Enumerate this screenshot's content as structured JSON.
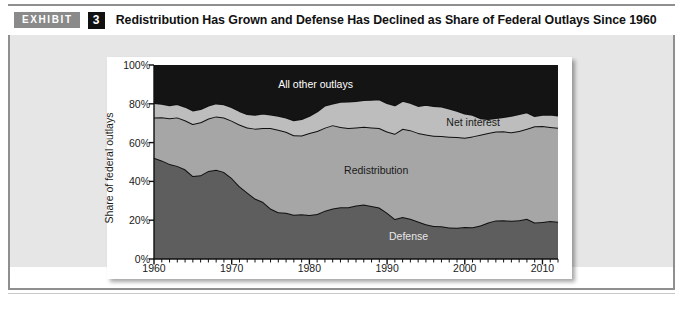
{
  "header": {
    "badge_label": "EXHIBIT",
    "exhibit_number": "3",
    "title": "Redistribution Has Grown and Defense Has Declined as Share of Federal Outlays Since 1960"
  },
  "chart_data": {
    "type": "area",
    "stacked": true,
    "title": "",
    "xlabel": "",
    "ylabel": "Share of federal outlays",
    "xlim": [
      1960,
      2012
    ],
    "ylim": [
      0,
      100
    ],
    "yticks": [
      "0%",
      "20%",
      "40%",
      "60%",
      "80%",
      "100%"
    ],
    "ytick_values": [
      0,
      20,
      40,
      60,
      80,
      100
    ],
    "xticks": [
      "1960",
      "1970",
      "1980",
      "1990",
      "2000",
      "2010"
    ],
    "xtick_values": [
      1960,
      1970,
      1980,
      1990,
      2000,
      2010
    ],
    "minor_tick_interval": 1,
    "grid": false,
    "legend": "inline-labels",
    "x": [
      1960,
      1961,
      1962,
      1963,
      1964,
      1965,
      1966,
      1967,
      1968,
      1969,
      1970,
      1971,
      1972,
      1973,
      1974,
      1975,
      1976,
      1977,
      1978,
      1979,
      1980,
      1981,
      1982,
      1983,
      1984,
      1985,
      1986,
      1987,
      1988,
      1989,
      1990,
      1991,
      1992,
      1993,
      1994,
      1995,
      1996,
      1997,
      1998,
      1999,
      2000,
      2001,
      2002,
      2003,
      2004,
      2005,
      2006,
      2007,
      2008,
      2009,
      2010,
      2011,
      2012
    ],
    "series": [
      {
        "name": "Defense",
        "color": "#5e5e5e",
        "label_color": "#e8e8e8",
        "values": [
          52.2,
          50.8,
          49.0,
          48.0,
          46.2,
          42.8,
          43.2,
          45.4,
          46.0,
          44.9,
          41.8,
          37.5,
          34.3,
          31.2,
          29.5,
          26.0,
          24.1,
          23.8,
          22.8,
          23.1,
          22.7,
          23.2,
          24.9,
          26.0,
          26.7,
          26.7,
          27.6,
          28.1,
          27.3,
          26.5,
          23.9,
          20.6,
          21.6,
          20.7,
          19.3,
          17.9,
          17.0,
          16.9,
          16.2,
          16.1,
          16.5,
          16.4,
          17.3,
          18.8,
          19.9,
          20.0,
          19.7,
          20.0,
          20.7,
          18.8,
          19.1,
          19.6,
          19.2
        ]
      },
      {
        "name": "Redistribution",
        "color": "#a6a6a6",
        "label_color": "#1a1a1a",
        "values": [
          20.8,
          22.3,
          23.5,
          25.0,
          25.3,
          26.8,
          27.3,
          27.0,
          27.5,
          28.0,
          29.5,
          31.8,
          33.5,
          36.0,
          38.0,
          41.5,
          42.5,
          41.8,
          41.0,
          40.6,
          42.2,
          42.8,
          42.8,
          43.0,
          41.3,
          40.8,
          40.2,
          40.1,
          40.5,
          41.0,
          41.8,
          44.0,
          45.5,
          45.7,
          45.7,
          46.3,
          46.5,
          46.5,
          46.8,
          46.8,
          46.0,
          46.8,
          46.8,
          46.2,
          45.8,
          45.8,
          45.6,
          46.0,
          46.4,
          49.6,
          49.5,
          48.5,
          48.4
        ]
      },
      {
        "name": "Net interest",
        "color": "#bdbdbd",
        "label_color": "#1a1a1a",
        "values": [
          7.4,
          6.9,
          6.7,
          6.9,
          7.0,
          7.0,
          6.8,
          6.7,
          6.7,
          6.9,
          7.0,
          7.0,
          6.9,
          7.1,
          7.5,
          7.0,
          7.2,
          7.3,
          7.7,
          8.4,
          8.9,
          10.1,
          11.4,
          11.1,
          13.0,
          13.7,
          13.7,
          13.8,
          14.3,
          14.8,
          14.7,
          14.6,
          14.4,
          14.1,
          13.9,
          15.3,
          15.4,
          15.2,
          14.6,
          13.5,
          12.5,
          11.1,
          8.5,
          7.1,
          7.0,
          7.4,
          8.5,
          8.7,
          8.5,
          5.3,
          5.7,
          6.4,
          6.3
        ]
      },
      {
        "name": "All other outlays",
        "color": "#141414",
        "label_color": "#ffffff",
        "values": [
          19.6,
          20.0,
          20.8,
          20.1,
          21.5,
          23.4,
          22.7,
          20.9,
          19.8,
          20.2,
          21.7,
          23.7,
          25.3,
          25.7,
          25.0,
          25.5,
          26.2,
          27.1,
          28.5,
          27.9,
          26.2,
          23.9,
          20.9,
          19.9,
          19.0,
          18.8,
          18.5,
          18.0,
          17.9,
          17.7,
          19.6,
          20.8,
          18.5,
          19.5,
          21.1,
          20.5,
          21.1,
          21.4,
          22.4,
          23.6,
          25.0,
          25.7,
          27.4,
          27.9,
          27.3,
          26.8,
          26.2,
          25.3,
          24.4,
          26.3,
          25.7,
          25.5,
          26.1
        ]
      }
    ],
    "annotations": [
      {
        "text": "All other outlays",
        "x_pct": 40,
        "y_pct": 90,
        "color": "#ffffff"
      },
      {
        "text": "Net interest",
        "x_pct": 79,
        "y_pct": 70.5,
        "color": "#1a1a1a"
      },
      {
        "text": "Redistribution",
        "x_pct": 55,
        "y_pct": 46,
        "color": "#1a1a1a"
      },
      {
        "text": "Defense",
        "x_pct": 63,
        "y_pct": 12,
        "color": "#e8e8e8"
      }
    ]
  },
  "colors": {
    "badge_bg": "#8a8a8a",
    "number_bg": "#111111",
    "panel_bg": "#e6e6e6",
    "rule": "#8f8f8f"
  }
}
